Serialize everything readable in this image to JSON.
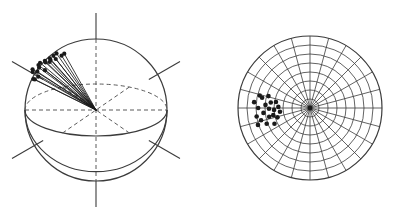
{
  "figure": {
    "title": "",
    "background_color": "#ffffff",
    "width": 397,
    "height": 219,
    "stroke_color": "#3b3b3b",
    "dot_color": "#1a1a1a",
    "dashed_color": "#5a5a5a"
  },
  "panels": [
    {
      "id": "sphere-panel",
      "name": "spherical-projection-panel",
      "caption": "",
      "center_x": 96,
      "center_y": 110,
      "radius": 71,
      "equator_ellipse_ry": 26,
      "axes": [
        {
          "name": "vertical-axis",
          "angle_deg": 90,
          "style": "solid-outside-dashed-inside"
        },
        {
          "name": "diagonal-axis-left",
          "angle_deg": 150,
          "style": "solid-stub"
        },
        {
          "name": "diagonal-axis-right",
          "angle_deg": 30,
          "style": "solid-stub"
        }
      ],
      "axis_stub_length": 26,
      "equator_diameters": [
        {
          "name": "equator-diameter-major",
          "style": "dashed"
        },
        {
          "name": "equator-diameter-oblique-a",
          "style": "dashed"
        },
        {
          "name": "equator-diameter-oblique-b",
          "style": "dashed"
        }
      ]
    },
    {
      "id": "polar-panel",
      "name": "polar-net-panel",
      "caption": "",
      "center_x": 310,
      "center_y": 108,
      "radius": 72,
      "ring_count": 8,
      "radial_spoke_count": 24,
      "radial_spoke_step_deg": 15,
      "grid_projection": "equal-area"
    }
  ],
  "chart_data": {
    "type": "scatter",
    "title": "",
    "subtitle": "",
    "xlabel": "",
    "ylabel": "",
    "grid": true,
    "legend_position": "none",
    "axis_ranges": {
      "azimuth_deg": [
        0,
        360
      ],
      "plunge_deg": [
        0,
        90
      ]
    },
    "series": [
      {
        "name": "orientation-vectors",
        "panel": "sphere-panel",
        "marker": "filled-circle-tipped-line",
        "count": 20,
        "points": [
          {
            "azimuth_deg": 188,
            "plunge_deg": 44,
            "length": 0.97
          },
          {
            "azimuth_deg": 191,
            "plunge_deg": 40,
            "length": 0.99
          },
          {
            "azimuth_deg": 194,
            "plunge_deg": 36,
            "length": 0.95
          },
          {
            "azimuth_deg": 197,
            "plunge_deg": 48,
            "length": 0.93
          },
          {
            "azimuth_deg": 200,
            "plunge_deg": 31,
            "length": 1.0
          },
          {
            "azimuth_deg": 183,
            "plunge_deg": 38,
            "length": 0.9
          },
          {
            "azimuth_deg": 186,
            "plunge_deg": 33,
            "length": 0.96
          },
          {
            "azimuth_deg": 203,
            "plunge_deg": 42,
            "length": 0.92
          },
          {
            "azimuth_deg": 206,
            "plunge_deg": 28,
            "length": 0.98
          },
          {
            "azimuth_deg": 180,
            "plunge_deg": 46,
            "length": 0.94
          },
          {
            "azimuth_deg": 196,
            "plunge_deg": 25,
            "length": 0.91
          },
          {
            "azimuth_deg": 209,
            "plunge_deg": 35,
            "length": 0.97
          },
          {
            "azimuth_deg": 189,
            "plunge_deg": 52,
            "length": 0.89
          },
          {
            "azimuth_deg": 199,
            "plunge_deg": 55,
            "length": 0.93
          },
          {
            "azimuth_deg": 178,
            "plunge_deg": 30,
            "length": 0.95
          },
          {
            "azimuth_deg": 212,
            "plunge_deg": 45,
            "length": 0.9
          },
          {
            "azimuth_deg": 192,
            "plunge_deg": 58,
            "length": 0.88
          },
          {
            "azimuth_deg": 204,
            "plunge_deg": 51,
            "length": 0.92
          },
          {
            "azimuth_deg": 185,
            "plunge_deg": 26,
            "length": 0.96
          },
          {
            "azimuth_deg": 207,
            "plunge_deg": 60,
            "length": 0.87
          }
        ]
      },
      {
        "name": "projected-orientation-points",
        "panel": "polar-panel",
        "marker": "filled-circle",
        "count": 21,
        "points": [
          {
            "azimuth_deg": 180,
            "radius_frac": 0.72
          },
          {
            "azimuth_deg": 176,
            "radius_frac": 0.62
          },
          {
            "azimuth_deg": 186,
            "radius_frac": 0.65
          },
          {
            "azimuth_deg": 192,
            "radius_frac": 0.58
          },
          {
            "azimuth_deg": 172,
            "radius_frac": 0.55
          },
          {
            "azimuth_deg": 183,
            "radius_frac": 0.5
          },
          {
            "azimuth_deg": 196,
            "radius_frac": 0.47
          },
          {
            "azimuth_deg": 168,
            "radius_frac": 0.68
          },
          {
            "azimuth_deg": 189,
            "radius_frac": 0.75
          },
          {
            "azimuth_deg": 200,
            "radius_frac": 0.64
          },
          {
            "azimuth_deg": 164,
            "radius_frac": 0.6
          },
          {
            "azimuth_deg": 178,
            "radius_frac": 0.44
          },
          {
            "azimuth_deg": 194,
            "radius_frac": 0.7
          },
          {
            "azimuth_deg": 170,
            "radius_frac": 0.48
          },
          {
            "azimuth_deg": 204,
            "radius_frac": 0.54
          },
          {
            "azimuth_deg": 181,
            "radius_frac": 0.57
          },
          {
            "azimuth_deg": 187,
            "radius_frac": 0.42
          },
          {
            "azimuth_deg": 174,
            "radius_frac": 0.78
          },
          {
            "azimuth_deg": 198,
            "radius_frac": 0.76
          },
          {
            "azimuth_deg": 166,
            "radius_frac": 0.72
          },
          {
            "azimuth_deg": 191,
            "radius_frac": 0.52
          }
        ]
      }
    ]
  }
}
